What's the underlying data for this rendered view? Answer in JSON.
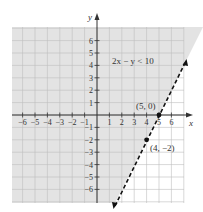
{
  "chart_data": {
    "type": "line",
    "title": "",
    "inequality": "2x − y < 10",
    "boundary_line": {
      "equation": "2x - y = 10",
      "style": "dashed"
    },
    "shaded_region": "left/above of line (2x - y < 10)",
    "xlabel": "x",
    "ylabel": "y",
    "xlim": [
      -7,
      7
    ],
    "ylim": [
      -7,
      7
    ],
    "x_ticks": [
      -6,
      -5,
      -4,
      -3,
      -2,
      -1,
      1,
      2,
      3,
      4,
      5,
      6
    ],
    "y_ticks": [
      6,
      5,
      4,
      3,
      2,
      1,
      -1,
      -2,
      -3,
      -4,
      -5,
      -6
    ],
    "grid": true,
    "points": [
      {
        "x": 5,
        "y": 0,
        "label": "(5, 0)"
      },
      {
        "x": 4,
        "y": -2,
        "label": "(4, −2)"
      }
    ]
  },
  "labels": {
    "x_axis": "x",
    "y_axis": "y",
    "inequality": "2x − y < 10",
    "point1": "(5, 0)",
    "point2": "(4, −2)"
  },
  "colors": {
    "shade": "#e3e3e3",
    "grid": "#bdbdbd",
    "axis": "#333333",
    "line": "#111111"
  }
}
